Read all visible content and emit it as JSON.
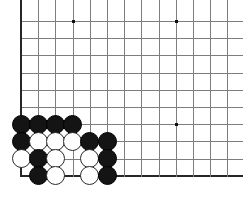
{
  "diagram": {
    "kind": "go-board-corner-diagram",
    "board": {
      "origin_x": 21,
      "origin_y": 21,
      "spacing": 17.2,
      "cols": 13,
      "rows": 10,
      "line_color": "#7d7d7d",
      "edge_color": "#262626",
      "background_color": "#ffffff"
    },
    "edges": {
      "left": true,
      "bottom": true,
      "top": false,
      "right": false
    },
    "star_points": [
      {
        "col": 4,
        "row": 1
      },
      {
        "col": 10,
        "row": 1
      },
      {
        "col": 10,
        "row": 7
      }
    ],
    "stone_colors": {
      "black": "#141414",
      "white": "#ffffff",
      "white_outline": "#2b2b2b"
    },
    "stones": [
      {
        "col": 1,
        "row": 7,
        "color": "black"
      },
      {
        "col": 2,
        "row": 7,
        "color": "black"
      },
      {
        "col": 3,
        "row": 7,
        "color": "black"
      },
      {
        "col": 4,
        "row": 7,
        "color": "black"
      },
      {
        "col": 1,
        "row": 8,
        "color": "black"
      },
      {
        "col": 2,
        "row": 8,
        "color": "white"
      },
      {
        "col": 3,
        "row": 8,
        "color": "white"
      },
      {
        "col": 4,
        "row": 8,
        "color": "white"
      },
      {
        "col": 5,
        "row": 8,
        "color": "black"
      },
      {
        "col": 6,
        "row": 8,
        "color": "black"
      },
      {
        "col": 1,
        "row": 9,
        "color": "white"
      },
      {
        "col": 2,
        "row": 9,
        "color": "black"
      },
      {
        "col": 3,
        "row": 9,
        "color": "white"
      },
      {
        "col": 5,
        "row": 9,
        "color": "white"
      },
      {
        "col": 6,
        "row": 9,
        "color": "black"
      },
      {
        "col": 2,
        "row": 10,
        "color": "black"
      },
      {
        "col": 3,
        "row": 10,
        "color": "white"
      },
      {
        "col": 5,
        "row": 10,
        "color": "white"
      },
      {
        "col": 6,
        "row": 10,
        "color": "black"
      }
    ]
  }
}
